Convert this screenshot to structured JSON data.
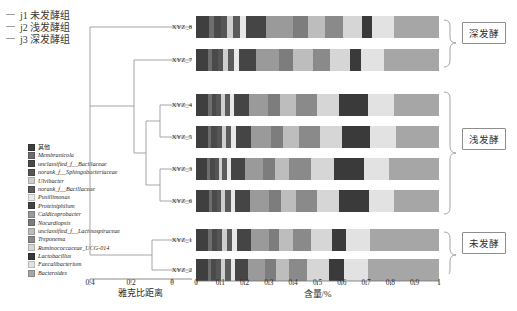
{
  "group_key": {
    "items": [
      {
        "label": "j1 未发酵组"
      },
      {
        "label": "j2 浅发酵组"
      },
      {
        "label": "j3 深发酵组"
      }
    ]
  },
  "axes": {
    "bar": {
      "title": "含量/%",
      "ticks": [
        "0",
        "0.1",
        "0.2",
        "0.3",
        "0.4",
        "0.5",
        "0.6",
        "0.7",
        "0.8",
        "0.9",
        "1"
      ],
      "min": 0,
      "max": 1
    },
    "dendrogram": {
      "title": "雅克比距离",
      "ticks": [
        "0.4",
        "0.2",
        "0"
      ],
      "min": 0,
      "max": 0.5
    }
  },
  "groups": [
    {
      "label": "深发酵",
      "samples": [
        "XYZ_8",
        "XYZ_7"
      ]
    },
    {
      "label": "浅发酵",
      "samples": [
        "XYZ_4",
        "XYZ_5",
        "XYZ_3",
        "XYZ_6"
      ]
    },
    {
      "label": "未发酵",
      "samples": [
        "XYZ_1",
        "XYZ_2"
      ]
    }
  ],
  "chart_data": {
    "type": "bar",
    "title": "",
    "xlabel": "含量/%",
    "ylabel": "",
    "xlim": [
      0,
      1
    ],
    "orientation": "horizontal",
    "stacked": true,
    "normalized": true,
    "grid": false,
    "legend_position": "left",
    "categories": [
      "XYZ_8",
      "XYZ_7",
      "XYZ_4",
      "XYZ_5",
      "XYZ_3",
      "XYZ_6",
      "XYZ_1",
      "XYZ_2"
    ],
    "series": [
      {
        "name": "其他",
        "color": "#3f3f3f",
        "values": [
          0.055,
          0.05,
          0.05,
          0.048,
          0.046,
          0.052,
          0.05,
          0.048
        ]
      },
      {
        "name": "Membranicola",
        "color": "#6e6e6e",
        "values": [
          0.02,
          0.016,
          0.014,
          0.015,
          0.013,
          0.014,
          0.016,
          0.015
        ]
      },
      {
        "name": "unclassified_f__Bacillaceae",
        "color": "#4a4a4a",
        "values": [
          0.028,
          0.024,
          0.02,
          0.022,
          0.018,
          0.02,
          0.022,
          0.021
        ]
      },
      {
        "name": "norank_f__Sphingobacteriaceae",
        "color": "#565656",
        "values": [
          0.026,
          0.022,
          0.018,
          0.02,
          0.017,
          0.019,
          0.02,
          0.019
        ]
      },
      {
        "name": "Ulvibacter",
        "color": "#cfcfcf",
        "values": [
          0.022,
          0.018,
          0.016,
          0.017,
          0.015,
          0.016,
          0.018,
          0.017
        ]
      },
      {
        "name": "norank_f__Bacillaceae",
        "color": "#5b5b5b",
        "values": [
          0.03,
          0.026,
          0.022,
          0.024,
          0.02,
          0.022,
          0.024,
          0.023
        ]
      },
      {
        "name": "Pusillimonas",
        "color": "#e8e8e8",
        "values": [
          0.024,
          0.02,
          0.018,
          0.019,
          0.017,
          0.018,
          0.019,
          0.018
        ]
      },
      {
        "name": "Proteiniphilum",
        "color": "#454545",
        "values": [
          0.085,
          0.072,
          0.06,
          0.062,
          0.056,
          0.06,
          0.058,
          0.055
        ]
      },
      {
        "name": "Caldicoprobacter",
        "color": "#9a9a9a",
        "values": [
          0.11,
          0.095,
          0.08,
          0.082,
          0.076,
          0.08,
          0.072,
          0.07
        ]
      },
      {
        "name": "Nocardiopsis",
        "color": "#7d7d7d",
        "values": [
          0.062,
          0.058,
          0.048,
          0.05,
          0.046,
          0.048,
          0.044,
          0.042
        ]
      },
      {
        "name": "unclassified_f__Lachnospiraceae",
        "color": "#bdbdbd",
        "values": [
          0.068,
          0.079,
          0.064,
          0.065,
          0.06,
          0.063,
          0.058,
          0.056
        ]
      },
      {
        "name": "Treponema",
        "color": "#8a8a8a",
        "values": [
          0.075,
          0.07,
          0.088,
          0.086,
          0.09,
          0.087,
          0.072,
          0.074
        ]
      },
      {
        "name": "Ruminococcaceae_UCG-014",
        "color": "#d6d6d6",
        "values": [
          0.08,
          0.085,
          0.092,
          0.09,
          0.094,
          0.091,
          0.086,
          0.088
        ]
      },
      {
        "name": "Lactobacillus",
        "color": "#3a3a3a",
        "values": [
          0.04,
          0.045,
          0.12,
          0.118,
          0.125,
          0.121,
          0.06,
          0.062
        ]
      },
      {
        "name": "Faecalibacterium",
        "color": "#e2e2e2",
        "values": [
          0.09,
          0.095,
          0.105,
          0.106,
          0.102,
          0.104,
          0.098,
          0.1
        ]
      },
      {
        "name": "Bacteroides",
        "color": "#a6a6a6",
        "values": [
          0.185,
          0.225,
          0.185,
          0.176,
          0.205,
          0.185,
          0.283,
          0.292
        ]
      }
    ]
  }
}
